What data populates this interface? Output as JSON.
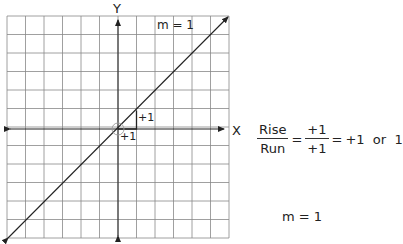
{
  "graph": {
    "y_axis_label": "Y",
    "x_axis_label": "X",
    "slope_label": "m = 1",
    "rise_label": "+1",
    "run_label": "+1",
    "grid": {
      "columns": 12,
      "rows": 12
    }
  },
  "equation": {
    "numerator_left": "Rise",
    "denominator_left": "Run",
    "equals1": "=",
    "numerator_right": "+1",
    "denominator_right": "+1",
    "equals2": "=",
    "result": "+1  or  1"
  },
  "conclusion": "m = 1"
}
